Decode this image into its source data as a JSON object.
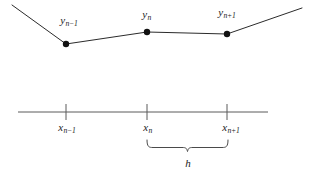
{
  "figure": {
    "background_color": "#ffffff",
    "width": 314,
    "height": 177
  },
  "curve": {
    "name": "function-curve",
    "stroke_color": "#2b2b2b",
    "stroke_width": 1,
    "points": [
      {
        "x": 12,
        "y": 5
      },
      {
        "x": 66,
        "y": 44
      },
      {
        "x": 147,
        "y": 32
      },
      {
        "x": 227,
        "y": 34
      },
      {
        "x": 302,
        "y": 8
      }
    ]
  },
  "markers": {
    "name": "sample-points",
    "fill_color": "#111111",
    "radius": 3.2,
    "items": [
      {
        "id": "point-n-minus-1",
        "x": 66,
        "y": 44
      },
      {
        "id": "point-n",
        "x": 147,
        "y": 32
      },
      {
        "id": "point-n-plus-1",
        "x": 227,
        "y": 34
      }
    ]
  },
  "y_labels": [
    {
      "id": "y-label-n-minus-1",
      "base": "y",
      "sub_index": "n",
      "sub_op": "−",
      "sub_offset": "1",
      "text": "y_{n-1}",
      "x": 69,
      "y": 15
    },
    {
      "id": "y-label-n",
      "base": "y",
      "sub_index": "n",
      "sub_op": "",
      "sub_offset": "",
      "text": "y_n",
      "x": 147,
      "y": 9
    },
    {
      "id": "y-label-n-plus-1",
      "base": "y",
      "sub_index": "n",
      "sub_op": "+",
      "sub_offset": "1",
      "text": "y_{n+1}",
      "x": 227,
      "y": 7
    }
  ],
  "axis": {
    "name": "x-axis",
    "stroke_color": "#5a5a5a",
    "stroke_width": 1,
    "y": 112,
    "x_start": 18,
    "x_end": 268
  },
  "ticks": {
    "name": "axis-ticks",
    "stroke_color": "#5a5a5a",
    "stroke_width": 1,
    "y_top": 104,
    "y_bottom": 120,
    "positions": [
      66,
      147,
      227
    ]
  },
  "x_labels": [
    {
      "id": "x-label-n-minus-1",
      "base": "x",
      "sub_index": "n",
      "sub_op": "−",
      "sub_offset": "1",
      "text": "x_{n-1}",
      "x": 67,
      "y": 122
    },
    {
      "id": "x-label-n",
      "base": "x",
      "sub_index": "n",
      "sub_op": "",
      "sub_offset": "",
      "text": "x_n",
      "x": 148,
      "y": 122
    },
    {
      "id": "x-label-n-plus-1",
      "base": "x",
      "sub_index": "n",
      "sub_op": "+",
      "sub_offset": "1",
      "text": "x_{n+1}",
      "x": 231,
      "y": 122
    }
  ],
  "brace": {
    "name": "spacing-brace",
    "stroke_color": "#4a4a4a",
    "stroke_width": 1,
    "x_left": 147,
    "x_right": 228,
    "y_top": 140,
    "y_bottom": 152,
    "label": {
      "id": "brace-label-h",
      "text": "h",
      "x": 188,
      "y": 158
    }
  }
}
